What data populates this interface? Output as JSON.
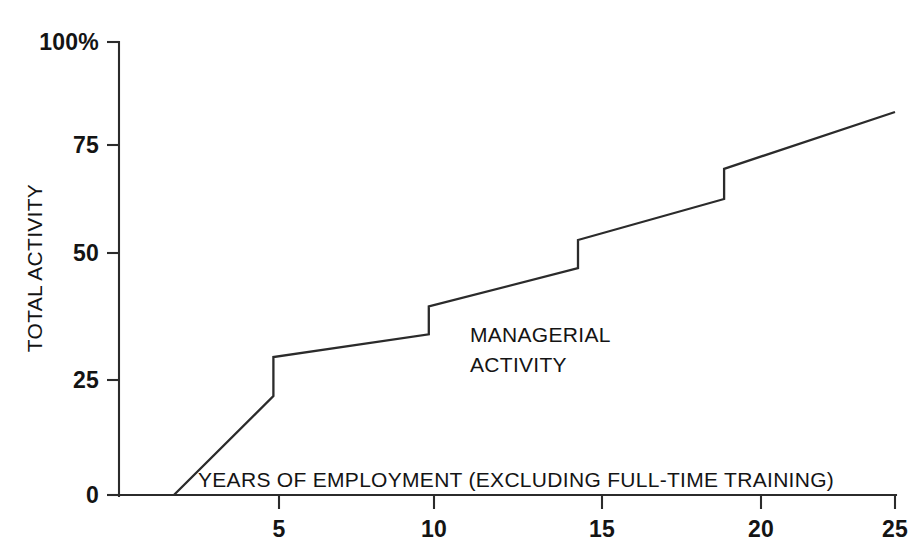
{
  "chart_data": {
    "type": "line",
    "title": "",
    "subtitle": "",
    "xlabel": "YEARS OF EMPLOYMENT (EXCLUDING FULL-TIME TRAINING)",
    "ylabel": "TOTAL ACTIVITY",
    "xlim": [
      0,
      25
    ],
    "ylim": [
      0,
      100
    ],
    "grid": false,
    "legend_position": "none",
    "x_ticks": [
      5,
      10,
      15,
      20,
      25
    ],
    "x_tick_labels": [
      "5",
      "10",
      "15",
      "20",
      "25"
    ],
    "y_ticks": [
      0,
      25,
      50,
      75,
      100
    ],
    "y_tick_labels": [
      "0",
      "25",
      "50",
      "75",
      "100%"
    ],
    "annotations": [
      {
        "name": "managerial-activity",
        "line1": "MANAGERIAL",
        "line2": "ACTIVITY",
        "x": 11.3,
        "y": 27
      }
    ],
    "series": [
      {
        "name": "Managerial activity",
        "step_style": "rising steps with sloping segments",
        "points": [
          {
            "x": 1.8,
            "y": 0
          },
          {
            "x": 5.0,
            "y": 21.5
          },
          {
            "x": 5.0,
            "y": 29.5
          },
          {
            "x": 10.0,
            "y": 34.0
          },
          {
            "x": 10.0,
            "y": 39.5
          },
          {
            "x": 14.8,
            "y": 47.0
          },
          {
            "x": 14.8,
            "y": 53.0
          },
          {
            "x": 19.5,
            "y": 62.5
          },
          {
            "x": 19.5,
            "y": 69.5
          },
          {
            "x": 25.0,
            "y": 83.0
          }
        ]
      }
    ],
    "colors": {
      "line": "#2b2b2b",
      "axis": "#2b2b2b",
      "text": "#141414",
      "background": "#ffffff"
    }
  }
}
